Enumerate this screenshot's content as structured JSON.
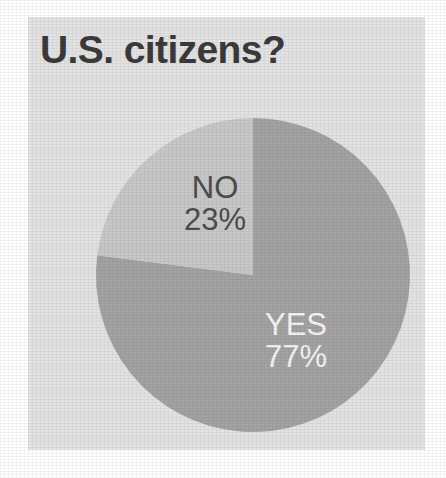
{
  "figure": {
    "title": "U.S. citizens?",
    "card_color": "#e3e3e3",
    "page_color": "#ffffff",
    "title_color": "#3b3b3b"
  },
  "chart_data": {
    "type": "pie",
    "title": "U.S. citizens?",
    "xlabel": "",
    "ylabel": "",
    "categories": [
      "YES",
      "NO"
    ],
    "values": [
      77,
      23
    ],
    "unit": "%",
    "slices": [
      {
        "label": "YES",
        "value": 77,
        "value_text": "77%",
        "color": "#a3a3a3",
        "text_color": "#f4f4f4",
        "start_angle_deg": 0,
        "end_angle_deg": 277.2,
        "direction": "counterclockwise-from-top-for-other-slice"
      },
      {
        "label": "NO",
        "value": 23,
        "value_text": "23%",
        "color": "#c8c8c8",
        "text_color": "#4d4d4d",
        "start_angle_deg": 277.2,
        "end_angle_deg": 360
      }
    ],
    "legend": "none",
    "legend_position": "inside-slices",
    "grid": false,
    "start_angle_note": "first boundary at 12 o'clock, NO slice occupies upper-left quadrant"
  },
  "geometry": {
    "center_x": 253,
    "center_y": 275,
    "radius": 157
  }
}
